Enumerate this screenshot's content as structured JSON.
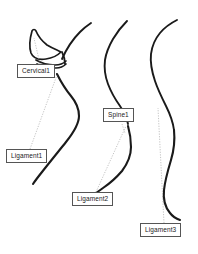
{
  "diagram": {
    "background_color": "#ffffff",
    "stroke_color": "#1a1a1a",
    "leader_line_color": "#9a9a9a",
    "callout_border_color": "#555555",
    "callout_background_color": "#ffffff",
    "figure_count": 3,
    "callouts": [
      {
        "id": "cervical1",
        "label": "Cervical1",
        "left": 17,
        "top": 64,
        "anchor_x": 40,
        "anchor_y": 64,
        "target_x": 34,
        "target_y": 38
      },
      {
        "id": "ligament1",
        "label": "Ligament1",
        "left": 6,
        "top": 149,
        "anchor_x": 30,
        "anchor_y": 149,
        "target_x": 57,
        "target_y": 75
      },
      {
        "id": "spine1",
        "label": "Spine1",
        "left": 103,
        "top": 108,
        "anchor_x": 122,
        "anchor_y": 124,
        "target_x": 125,
        "target_y": 132
      },
      {
        "id": "ligament2",
        "label": "Ligament2",
        "left": 72,
        "top": 192,
        "anchor_x": 96,
        "anchor_y": 192,
        "target_x": 126,
        "target_y": 126
      },
      {
        "id": "ligament3",
        "label": "Ligament3",
        "left": 140,
        "top": 223,
        "anchor_x": 164,
        "anchor_y": 223,
        "target_x": 158,
        "target_y": 108
      }
    ],
    "figures": [
      {
        "id": "figure-left-cervical",
        "name": "left-cervical-profile",
        "description": "Left profile with cervical vertebra outline and descending spinal curve"
      },
      {
        "id": "figure-middle-spine",
        "name": "middle-spine-profile",
        "description": "Middle profile showing a continuous spinal curve"
      },
      {
        "id": "figure-right-spine",
        "name": "right-spine-profile",
        "description": "Right profile showing a long continuous spinal curve"
      }
    ]
  }
}
